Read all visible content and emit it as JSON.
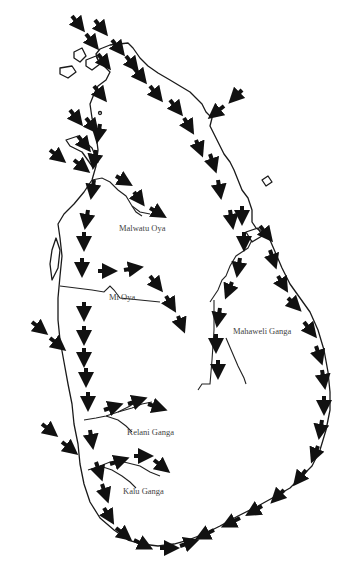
{
  "map": {
    "subject": "Sri Lanka",
    "background": "#ffffff",
    "line_color": "#1a1a1a",
    "arrow_color": "#111111",
    "rivers": [
      {
        "name": "Malwatu Oya",
        "x": 119,
        "y": 223
      },
      {
        "name": "Mi Oya",
        "x": 109,
        "y": 292
      },
      {
        "name": "Mahaweli Ganga",
        "x": 233,
        "y": 326
      },
      {
        "name": "Kelani Ganga",
        "x": 127,
        "y": 427
      },
      {
        "name": "Kalu Ganga",
        "x": 123,
        "y": 486
      }
    ],
    "arrows": {
      "description": "Flow direction arrows: NE monsoon from north-east, SW from north-west offshore, coastal arrows running south along west coast and anticlockwise around south coast",
      "count_approx": 90
    }
  }
}
